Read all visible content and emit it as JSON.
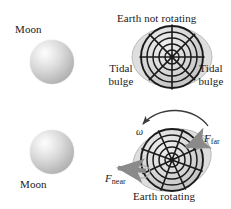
{
  "figure": {
    "width": 231,
    "height": 209,
    "background": "#ffffff",
    "style": "textbook-physics-diagram",
    "topic": "Tidal bulges raised on Earth by the Moon"
  },
  "colors": {
    "ink": "#1a1a1a",
    "earth_fill_outer": "#c9c9c9",
    "earth_fill_mid": "#d8d8d8",
    "earth_fill_inner": "#e8e8e8",
    "bulge_fill": "#dcdcdc",
    "bulge_stroke": "#b4b4b4",
    "arrow_gray": "#8c8c8c",
    "moon_light": "#fdfdfd",
    "moon_dark": "#9a9a9a"
  },
  "panels": [
    {
      "id": "top",
      "title": "Earth not rotating",
      "moon_label": "Moon",
      "moon_label_position": "above",
      "left_bulge_label": "Tidal\nbulge",
      "left_bulge_label_lines": [
        "Tidal",
        "bulge"
      ],
      "right_bulge_label_lines": [
        "Tidal",
        "bulge"
      ],
      "moon": {
        "cx": 52,
        "cy": 62,
        "r": 22
      },
      "earth": {
        "cx": 172,
        "cy": 57,
        "r": 31,
        "rings": 5,
        "radial_lines": 4,
        "axis_tilt_deg": 0
      },
      "bulges": {
        "side": "both",
        "extent_px": 9
      }
    },
    {
      "id": "bottom",
      "title": "Earth rotating",
      "moon_label": "Moon",
      "moon_label_position": "below",
      "angular_velocity_symbol": "ω",
      "force_far_label": "F",
      "force_far_subscript": "far",
      "force_near_label": "F",
      "force_near_subscript": "near",
      "moon": {
        "cx": 52,
        "cy": 152,
        "r": 22
      },
      "earth": {
        "cx": 172,
        "cy": 160,
        "r": 31,
        "rings": 5,
        "radial_lines": 4,
        "axis_tilt_deg": 20
      },
      "rotation_arrow": {
        "direction": "counterclockwise",
        "label": "ω"
      },
      "forces": [
        {
          "name": "F_far",
          "anchor": "right-upper",
          "points_toward": "moon"
        },
        {
          "name": "F_near",
          "anchor": "left",
          "points_toward": "moon"
        }
      ]
    }
  ],
  "labels": {
    "moon_top": "Moon",
    "moon_bottom": "Moon",
    "earth_not_rotating": "Earth not rotating",
    "earth_rotating": "Earth rotating",
    "tidal_left_line1": "Tidal",
    "tidal_left_line2": "bulge",
    "tidal_right_line1": "Tidal",
    "tidal_right_line2": "bulge",
    "omega": "ω",
    "f_far_base": "F",
    "f_far_sub": "far",
    "f_near_base": "F",
    "f_near_sub": "near"
  }
}
